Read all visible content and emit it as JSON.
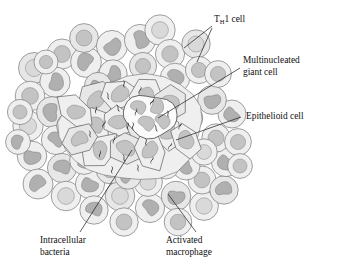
{
  "figure": {
    "background_color": "#ffffff"
  },
  "palette": {
    "cytoplasm_light": "#efefef",
    "cytoplasm_mid": "#e7e7e7",
    "nucleus_light": "#d9d9d9",
    "nucleus_mid": "#c3c3c3",
    "nucleus_dark": "#b0b0b0",
    "outline": "#6f6f6f",
    "bacteria": "#151515",
    "leader_line": "#1a1a1a",
    "text": "#111111"
  },
  "labels": [
    {
      "id": "th1-cell",
      "name": "T_H1 cell",
      "text_main": "T",
      "text_sub": "H",
      "text_rest": "1 cell",
      "x": 214,
      "y": 22,
      "lines": 1
    },
    {
      "id": "multinucleated-giant-cell",
      "name": "Multinucleated giant cell",
      "line1": "Multinucleated",
      "line2": "giant cell",
      "x": 243,
      "y": 63,
      "lines": 2
    },
    {
      "id": "epithelioid-cell",
      "name": "Epithelioid cell",
      "line1": "Epithelioid cell",
      "x": 243,
      "y": 116,
      "lines": 1
    },
    {
      "id": "intracellular-bacteria",
      "name": "Intracellular bacteria",
      "line1": "Intracellular",
      "line2": "bacteria",
      "x": 40,
      "y": 240,
      "lines": 2
    },
    {
      "id": "activated-macrophage",
      "name": "Activated macrophage",
      "line1": "Activated",
      "line2": "macrophage",
      "x": 166,
      "y": 240,
      "lines": 2
    }
  ],
  "legend_keys": {
    "lymphocyte": "Round-nucleus cell (T cell) in outer rim",
    "macrophage": "Kidney-bean nucleus cell (activated macrophage)",
    "epithelioid": "Irregular polygonal cell with oval nucleus in core",
    "giant_cell": "Large cell with several nuclei",
    "bacteria": "Short black rods inside core cells"
  },
  "counts": {
    "bacteria_rods": 22,
    "core_epithelioid_cells": 14,
    "rim_cells": 52
  },
  "chart_data": {
    "type": "diagram",
    "rim_cells": [
      {
        "cx": 34,
        "cy": 68,
        "r": 15.5,
        "nucleus": "round",
        "nr": 8.6
      },
      {
        "cx": 62,
        "cy": 54,
        "r": 15.0,
        "nucleus": "round",
        "nr": 8.4
      },
      {
        "cx": 55,
        "cy": 82,
        "r": 15.2,
        "nucleus": "bean",
        "nr": 8.8
      },
      {
        "cx": 86,
        "cy": 62,
        "r": 15.4,
        "nucleus": "bean",
        "nr": 8.9
      },
      {
        "cx": 84,
        "cy": 38,
        "r": 14.4,
        "nucleus": "round",
        "nr": 8.0
      },
      {
        "cx": 112,
        "cy": 46,
        "r": 15.6,
        "nucleus": "bean",
        "nr": 9.0
      },
      {
        "cx": 113,
        "cy": 74,
        "r": 14.2,
        "nucleus": "bean",
        "nr": 8.2
      },
      {
        "cx": 140,
        "cy": 40,
        "r": 15.6,
        "nucleus": "bean",
        "nr": 9.0
      },
      {
        "cx": 143,
        "cy": 66,
        "r": 13.6,
        "nucleus": "round",
        "nr": 7.6
      },
      {
        "cx": 160,
        "cy": 30,
        "r": 15.2,
        "nucleus": "round",
        "nr": 8.4
      },
      {
        "cx": 170,
        "cy": 54,
        "r": 14.6,
        "nucleus": "round",
        "nr": 8.2
      },
      {
        "cx": 175,
        "cy": 78,
        "r": 14.8,
        "nucleus": "bean",
        "nr": 8.6
      },
      {
        "cx": 196,
        "cy": 44,
        "r": 14.2,
        "nucleus": "round",
        "nr": 8.0
      },
      {
        "cx": 199,
        "cy": 70,
        "r": 13.6,
        "nucleus": "round",
        "nr": 7.6
      },
      {
        "cx": 30,
        "cy": 96,
        "r": 14.8,
        "nucleus": "round",
        "nr": 8.4
      },
      {
        "cx": 28,
        "cy": 126,
        "r": 15.2,
        "nucleus": "round",
        "nr": 8.6
      },
      {
        "cx": 52,
        "cy": 112,
        "r": 15.4,
        "nucleus": "bean",
        "nr": 9.0
      },
      {
        "cx": 56,
        "cy": 140,
        "r": 14.6,
        "nucleus": "bean",
        "nr": 8.4
      },
      {
        "cx": 32,
        "cy": 156,
        "r": 14.8,
        "nucleus": "bean",
        "nr": 8.6
      },
      {
        "cx": 38,
        "cy": 184,
        "r": 15.0,
        "nucleus": "bean",
        "nr": 8.6
      },
      {
        "cx": 62,
        "cy": 168,
        "r": 14.6,
        "nucleus": "bean",
        "nr": 8.4
      },
      {
        "cx": 66,
        "cy": 196,
        "r": 14.8,
        "nucleus": "round",
        "nr": 8.4
      },
      {
        "cx": 90,
        "cy": 184,
        "r": 14.6,
        "nucleus": "bean",
        "nr": 8.4
      },
      {
        "cx": 94,
        "cy": 210,
        "r": 14.2,
        "nucleus": "bean",
        "nr": 8.2
      },
      {
        "cx": 120,
        "cy": 196,
        "r": 14.8,
        "nucleus": "round",
        "nr": 8.4
      },
      {
        "cx": 124,
        "cy": 222,
        "r": 14.2,
        "nucleus": "round",
        "nr": 8.0
      },
      {
        "cx": 150,
        "cy": 208,
        "r": 14.6,
        "nucleus": "bean",
        "nr": 8.4
      },
      {
        "cx": 148,
        "cy": 182,
        "r": 14.4,
        "nucleus": "round",
        "nr": 8.2
      },
      {
        "cx": 176,
        "cy": 196,
        "r": 14.8,
        "nucleus": "bean",
        "nr": 8.6
      },
      {
        "cx": 178,
        "cy": 222,
        "r": 13.8,
        "nucleus": "round",
        "nr": 7.8
      },
      {
        "cx": 204,
        "cy": 206,
        "r": 14.4,
        "nucleus": "round",
        "nr": 8.2
      },
      {
        "cx": 202,
        "cy": 180,
        "r": 14.0,
        "nucleus": "round",
        "nr": 7.9
      },
      {
        "cx": 224,
        "cy": 190,
        "r": 14.2,
        "nucleus": "bean",
        "nr": 8.2
      },
      {
        "cx": 226,
        "cy": 162,
        "r": 14.6,
        "nucleus": "bean",
        "nr": 8.4
      },
      {
        "cx": 216,
        "cy": 138,
        "r": 14.2,
        "nucleus": "round",
        "nr": 8.0
      },
      {
        "cx": 232,
        "cy": 114,
        "r": 14.0,
        "nucleus": "bean",
        "nr": 8.0
      },
      {
        "cx": 212,
        "cy": 100,
        "r": 14.4,
        "nucleus": "bean",
        "nr": 8.4
      },
      {
        "cx": 218,
        "cy": 74,
        "r": 13.4,
        "nucleus": "round",
        "nr": 7.6
      },
      {
        "cx": 238,
        "cy": 142,
        "r": 13.4,
        "nucleus": "round",
        "nr": 7.6
      },
      {
        "cx": 84,
        "cy": 160,
        "r": 14.4,
        "nucleus": "bean",
        "nr": 8.3
      },
      {
        "cx": 110,
        "cy": 170,
        "r": 13.8,
        "nucleus": "round",
        "nr": 7.8
      },
      {
        "cx": 186,
        "cy": 166,
        "r": 14.0,
        "nucleus": "bean",
        "nr": 8.0
      },
      {
        "cx": 204,
        "cy": 152,
        "r": 13.2,
        "nucleus": "round",
        "nr": 7.4
      },
      {
        "cx": 46,
        "cy": 62,
        "r": 12.0,
        "nucleus": "round",
        "nr": 6.6
      },
      {
        "cx": 98,
        "cy": 86,
        "r": 13.6,
        "nucleus": "bean",
        "nr": 7.8
      },
      {
        "cx": 70,
        "cy": 126,
        "r": 13.4,
        "nucleus": "round",
        "nr": 7.6
      },
      {
        "cx": 190,
        "cy": 118,
        "r": 12.8,
        "nucleus": "bean",
        "nr": 7.4
      },
      {
        "cx": 166,
        "cy": 166,
        "r": 13.0,
        "nucleus": "round",
        "nr": 7.4
      },
      {
        "cx": 128,
        "cy": 176,
        "r": 13.2,
        "nucleus": "bean",
        "nr": 7.6
      },
      {
        "cx": 240,
        "cy": 166,
        "r": 12.4,
        "nucleus": "round",
        "nr": 7.0
      },
      {
        "cx": 20,
        "cy": 112,
        "r": 12.6,
        "nucleus": "round",
        "nr": 7.0
      },
      {
        "cx": 18,
        "cy": 142,
        "r": 12.4,
        "nucleus": "bean",
        "nr": 7.0
      }
    ],
    "core_cells": [
      {
        "cx": 96,
        "cy": 100,
        "nucleus": "oval"
      },
      {
        "cx": 120,
        "cy": 94,
        "nucleus": "oval"
      },
      {
        "cx": 146,
        "cy": 96,
        "nucleus": "oval"
      },
      {
        "cx": 170,
        "cy": 104,
        "nucleus": "bean"
      },
      {
        "cx": 94,
        "cy": 126,
        "nucleus": "bean"
      },
      {
        "cx": 118,
        "cy": 122,
        "nucleus": "oval"
      },
      {
        "cx": 142,
        "cy": 124,
        "nucleus": "oval"
      },
      {
        "cx": 166,
        "cy": 130,
        "nucleus": "bean"
      },
      {
        "cx": 100,
        "cy": 150,
        "nucleus": "oval"
      },
      {
        "cx": 126,
        "cy": 148,
        "nucleus": "oval"
      },
      {
        "cx": 150,
        "cy": 150,
        "nucleus": "oval"
      },
      {
        "cx": 76,
        "cy": 112,
        "nucleus": "oval"
      },
      {
        "cx": 80,
        "cy": 140,
        "nucleus": "bean"
      },
      {
        "cx": 186,
        "cy": 140,
        "nucleus": "oval"
      }
    ],
    "bacteria": [
      {
        "x": 124,
        "y": 84,
        "angle": 75
      },
      {
        "x": 140,
        "y": 90,
        "angle": 100
      },
      {
        "x": 108,
        "y": 96,
        "angle": 65
      },
      {
        "x": 152,
        "y": 102,
        "angle": 115
      },
      {
        "x": 96,
        "y": 110,
        "angle": 85
      },
      {
        "x": 118,
        "y": 108,
        "angle": 60
      },
      {
        "x": 136,
        "y": 112,
        "angle": 95
      },
      {
        "x": 168,
        "y": 114,
        "angle": 70
      },
      {
        "x": 104,
        "y": 124,
        "angle": 105
      },
      {
        "x": 128,
        "y": 126,
        "angle": 80
      },
      {
        "x": 133,
        "y": 126,
        "angle": 80
      },
      {
        "x": 156,
        "y": 128,
        "angle": 60
      },
      {
        "x": 180,
        "y": 126,
        "angle": 100
      },
      {
        "x": 90,
        "y": 134,
        "angle": 70
      },
      {
        "x": 114,
        "y": 140,
        "angle": 95
      },
      {
        "x": 146,
        "y": 142,
        "angle": 75
      },
      {
        "x": 170,
        "y": 146,
        "angle": 110
      },
      {
        "x": 100,
        "y": 154,
        "angle": 85
      },
      {
        "x": 124,
        "y": 158,
        "angle": 65
      },
      {
        "x": 152,
        "y": 160,
        "angle": 100
      },
      {
        "x": 112,
        "y": 170,
        "angle": 80
      },
      {
        "x": 138,
        "y": 168,
        "angle": 70
      }
    ],
    "leader_lines": [
      {
        "label": "th1-cell",
        "points": "212,26 184,48"
      },
      {
        "label": "th1-cell",
        "points": "212,28 197,62"
      },
      {
        "label": "multinucleated-giant-cell",
        "points": "240,68 158,118"
      },
      {
        "label": "epithelioid-cell",
        "points": "241,117 176,140"
      },
      {
        "label": "intracellular-bacteria",
        "points": "80,232 132,150"
      },
      {
        "label": "activated-macrophage",
        "points": "196,232 168,194"
      }
    ]
  }
}
